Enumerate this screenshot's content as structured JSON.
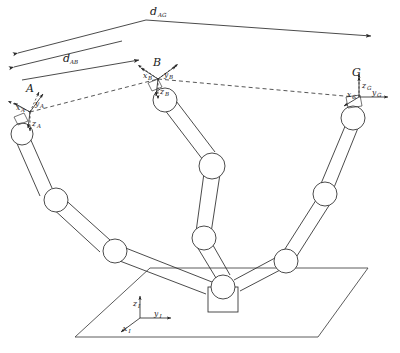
{
  "figure": {
    "type": "technical-line-diagram",
    "background_color": "#ffffff",
    "line_color": "#2b2b2b"
  },
  "dimensions": [
    {
      "id": "d_AG",
      "label": "d",
      "subscript": "AG",
      "description": "distance from frame A to frame G"
    },
    {
      "id": "d_AB",
      "label": "d",
      "subscript": "AB",
      "description": "distance from frame A to frame B"
    }
  ],
  "frames": [
    {
      "id": "A",
      "label": "A",
      "axes": [
        {
          "name": "x",
          "label": "x",
          "subscript": "A"
        },
        {
          "name": "y",
          "label": "y",
          "subscript": "A"
        },
        {
          "name": "z",
          "label": "z",
          "subscript": "A"
        }
      ]
    },
    {
      "id": "B",
      "label": "B",
      "axes": [
        {
          "name": "x",
          "label": "x",
          "subscript": "B"
        },
        {
          "name": "y",
          "label": "y",
          "subscript": "B"
        },
        {
          "name": "z",
          "label": "z",
          "subscript": "B"
        }
      ]
    },
    {
      "id": "G",
      "label": "G",
      "axes": [
        {
          "name": "x",
          "label": "x",
          "subscript": "G"
        },
        {
          "name": "y",
          "label": "y",
          "subscript": "G"
        },
        {
          "name": "z",
          "label": "z",
          "subscript": "G"
        }
      ]
    },
    {
      "id": "I",
      "label": "",
      "description": "inertial ground frame",
      "axes": [
        {
          "name": "x",
          "label": "x",
          "subscript": "I"
        },
        {
          "name": "y",
          "label": "y",
          "subscript": "I"
        },
        {
          "name": "z",
          "label": "z",
          "subscript": "I"
        }
      ]
    }
  ],
  "arms": [
    {
      "id": "arm-left",
      "end_frame": "A",
      "joint_count": 3,
      "link_count": 3
    },
    {
      "id": "arm-middle",
      "end_frame": "B",
      "joint_count": 3,
      "link_count": 3
    },
    {
      "id": "arm-right",
      "end_frame": "G",
      "joint_count": 3,
      "link_count": 3
    }
  ],
  "ground_plane": {
    "id": "ground-plane",
    "shape": "parallelogram"
  },
  "base": {
    "id": "robot-base",
    "shape": "rectangle"
  }
}
